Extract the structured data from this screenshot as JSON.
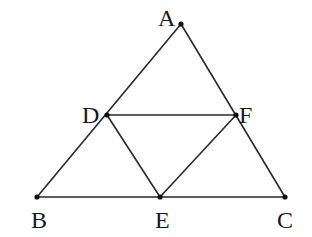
{
  "diagram": {
    "type": "geometry",
    "colors": {
      "line": "#2a2a2a",
      "point": "#111111",
      "label": "#1a1a1a",
      "background": "#ffffff"
    },
    "points": {
      "A": {
        "label": "A",
        "x": 181,
        "y": 24,
        "label_x": 158,
        "label_y": 26
      },
      "B": {
        "label": "B",
        "x": 37,
        "y": 197,
        "label_x": 31,
        "label_y": 228
      },
      "C": {
        "label": "C",
        "x": 285,
        "y": 197,
        "label_x": 277,
        "label_y": 228
      },
      "D": {
        "label": "D",
        "x": 107,
        "y": 115,
        "label_x": 82,
        "label_y": 123
      },
      "E": {
        "label": "E",
        "x": 160,
        "y": 197,
        "label_x": 155,
        "label_y": 228
      },
      "F": {
        "label": "F",
        "x": 236,
        "y": 115,
        "label_x": 239,
        "label_y": 123
      }
    },
    "segments": [
      {
        "from": "A",
        "to": "B"
      },
      {
        "from": "A",
        "to": "C"
      },
      {
        "from": "B",
        "to": "C"
      },
      {
        "from": "D",
        "to": "F"
      },
      {
        "from": "D",
        "to": "E"
      },
      {
        "from": "E",
        "to": "F"
      }
    ]
  }
}
